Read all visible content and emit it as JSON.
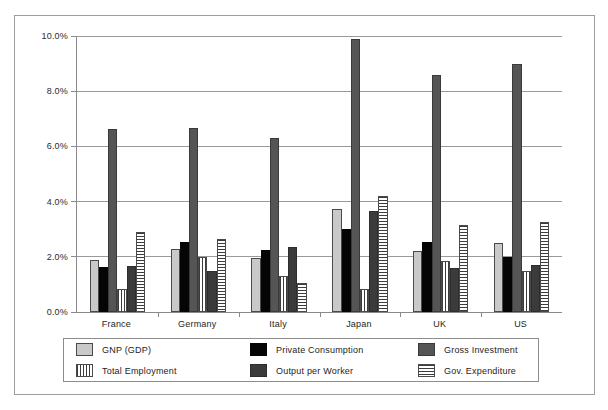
{
  "chart_data": {
    "type": "bar",
    "title": "",
    "subtitle": "",
    "xlabel": "",
    "ylabel": "",
    "ylim": [
      0,
      10
    ],
    "ytick_values": [
      0,
      2,
      4,
      6,
      8,
      10
    ],
    "ytick_labels": [
      "0.0%",
      "2.0%",
      "4.0%",
      "6.0%",
      "8.0%",
      "10.0%"
    ],
    "grid": true,
    "legend_position": "bottom",
    "categories": [
      "France",
      "Germany",
      "Italy",
      "Japan",
      "UK",
      "US"
    ],
    "series": [
      {
        "name": "GNP (GDP)",
        "pattern": "solid-light-gray",
        "color": "#c9c9c9",
        "values": [
          1.88,
          2.3,
          1.95,
          3.75,
          2.2,
          2.5
        ]
      },
      {
        "name": "Private Consumption",
        "pattern": "solid-black",
        "color": "#050505",
        "values": [
          1.62,
          2.55,
          2.25,
          3.0,
          2.55,
          2.0
        ]
      },
      {
        "name": "Gross Investment",
        "pattern": "solid-dark-gray",
        "color": "#555555",
        "values": [
          6.62,
          6.65,
          6.3,
          9.9,
          8.6,
          9.0
        ]
      },
      {
        "name": "Total Employment",
        "pattern": "vertical-stripes",
        "color": "#3c3c3c",
        "values": [
          0.85,
          2.0,
          1.3,
          0.85,
          1.85,
          1.5
        ]
      },
      {
        "name": "Output per Worker",
        "pattern": "solid-charcoal",
        "color": "#3b3b3b",
        "values": [
          1.65,
          1.48,
          2.35,
          3.65,
          1.6,
          1.7
        ]
      },
      {
        "name": "Gov. Expenditure",
        "pattern": "horizontal-stripes",
        "color": "#3c3c3c",
        "values": [
          2.9,
          2.65,
          1.05,
          4.2,
          3.15,
          3.25
        ]
      }
    ]
  },
  "legend": {
    "items": [
      {
        "label": "GNP (GDP)"
      },
      {
        "label": "Total Employment"
      },
      {
        "label": "Private Consumption"
      },
      {
        "label": "Output per Worker"
      },
      {
        "label": "Gross Investment"
      },
      {
        "label": "Gov. Expenditure"
      }
    ]
  }
}
